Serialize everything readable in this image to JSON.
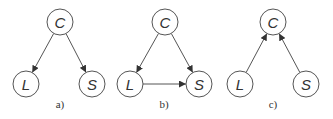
{
  "colors": {
    "stroke": "#555555",
    "text": "#333333",
    "background": "#ffffff"
  },
  "diagrams": [
    {
      "caption": "a)",
      "nodes": [
        {
          "id": "C",
          "label": "C",
          "x": 60,
          "y": 22
        },
        {
          "id": "L",
          "label": "L",
          "x": 26,
          "y": 84
        },
        {
          "id": "S",
          "label": "S",
          "x": 92,
          "y": 84
        }
      ],
      "edges": [
        {
          "from": "C",
          "to": "L"
        },
        {
          "from": "C",
          "to": "S"
        }
      ]
    },
    {
      "caption": "b)",
      "nodes": [
        {
          "id": "C",
          "label": "C",
          "x": 165,
          "y": 22
        },
        {
          "id": "L",
          "label": "L",
          "x": 130,
          "y": 84
        },
        {
          "id": "S",
          "label": "S",
          "x": 199,
          "y": 84
        }
      ],
      "edges": [
        {
          "from": "C",
          "to": "L"
        },
        {
          "from": "C",
          "to": "S"
        },
        {
          "from": "L",
          "to": "S"
        }
      ]
    },
    {
      "caption": "c)",
      "nodes": [
        {
          "id": "C",
          "label": "C",
          "x": 273,
          "y": 22
        },
        {
          "id": "L",
          "label": "L",
          "x": 240,
          "y": 84
        },
        {
          "id": "S",
          "label": "S",
          "x": 306,
          "y": 84
        }
      ],
      "edges": [
        {
          "from": "L",
          "to": "C"
        },
        {
          "from": "S",
          "to": "C"
        }
      ]
    }
  ]
}
